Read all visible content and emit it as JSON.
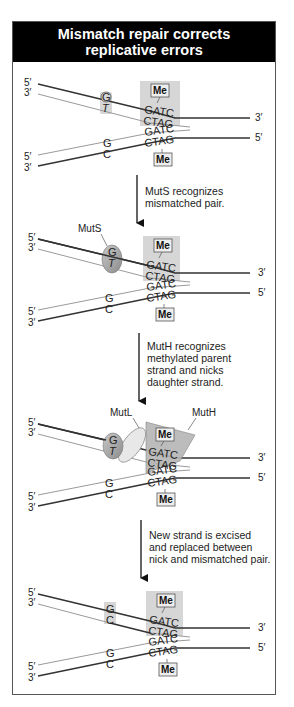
{
  "title": {
    "line1": "Mismatch repair corrects",
    "line2": "replicative errors"
  },
  "end_labels": {
    "five_prime": "5′",
    "three_prime": "3′"
  },
  "methyl_label": "Me",
  "sequences": {
    "top": "GATC",
    "bottom": "CTAG"
  },
  "panels": [
    {
      "id": "panel-1",
      "mismatch": {
        "top": "G",
        "bottom": "T"
      },
      "lower_pair": {
        "top": "G",
        "bottom": "C"
      }
    },
    {
      "id": "panel-2",
      "protein_labels": [
        "MutS"
      ],
      "mismatch": {
        "top": "G",
        "bottom": "T"
      },
      "lower_pair": {
        "top": "G",
        "bottom": "C"
      }
    },
    {
      "id": "panel-3",
      "protein_labels": [
        "MutL",
        "MutH"
      ],
      "mismatch": {
        "top": "G",
        "bottom": "T"
      },
      "lower_pair": {
        "top": "G",
        "bottom": "C"
      }
    },
    {
      "id": "panel-4",
      "mismatch": {
        "top": "G",
        "bottom": "C"
      },
      "lower_pair": {
        "top": "G",
        "bottom": "C"
      }
    }
  ],
  "steps": [
    {
      "line1": "MutS recognizes",
      "line2": "mismatched pair."
    },
    {
      "line1": "MutH recognizes",
      "line2": "methylated parent",
      "line3": "strand and nicks",
      "line4": "daughter strand."
    },
    {
      "line1": "New strand is excised",
      "line2": "and replaced between",
      "line3": "nick and mismatched pair."
    }
  ],
  "colors": {
    "title_bg": "#000000",
    "title_fg": "#ffffff",
    "parent_strand": "#333333",
    "daughter_strand": "#9a9a9a",
    "highlight_box": "#d6d6d6",
    "protein_fill": "#a8a8a8"
  }
}
